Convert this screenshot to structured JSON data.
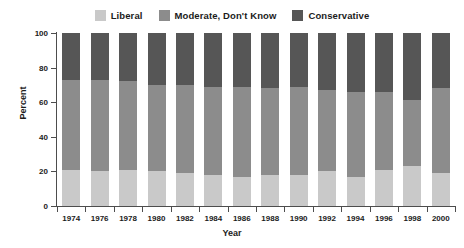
{
  "chart_data": {
    "type": "bar",
    "subtype": "stacked-bar-100-percent",
    "title": "",
    "xlabel": "Year",
    "ylabel": "Percent",
    "ylim": [
      0,
      100
    ],
    "yticks": [
      0,
      20,
      40,
      60,
      80,
      100
    ],
    "grid": false,
    "legend_position": "top-center",
    "categories": [
      "1974",
      "1976",
      "1978",
      "1980",
      "1982",
      "1984",
      "1986",
      "1988",
      "1990",
      "1992",
      "1994",
      "1996",
      "1998",
      "2000"
    ],
    "series": [
      {
        "name": "Liberal",
        "color": "#c9c9c9",
        "values": [
          21,
          20,
          21,
          20,
          19,
          18,
          17,
          18,
          18,
          20,
          17,
          21,
          23,
          19
        ]
      },
      {
        "name": "Moderate, Don't Know",
        "color": "#8c8c8c",
        "values": [
          52,
          53,
          51,
          50,
          51,
          51,
          52,
          50,
          51,
          47,
          49,
          45,
          38,
          49
        ]
      },
      {
        "name": "Conservative",
        "color": "#565656",
        "values": [
          27,
          27,
          28,
          30,
          30,
          31,
          31,
          32,
          31,
          33,
          34,
          34,
          39,
          32
        ]
      }
    ],
    "annotations": []
  },
  "legend": {
    "items": [
      {
        "label": "Liberal",
        "color": "#c9c9c9"
      },
      {
        "label": "Moderate, Don't Know",
        "color": "#8c8c8c"
      },
      {
        "label": "Conservative",
        "color": "#565656"
      }
    ]
  },
  "axes": {
    "y_title": "Percent",
    "x_title": "Year",
    "y_tick_labels": [
      "0",
      "20",
      "40",
      "60",
      "80",
      "100"
    ],
    "x_tick_labels": [
      "1974",
      "1976",
      "1978",
      "1980",
      "1982",
      "1984",
      "1986",
      "1988",
      "1990",
      "1992",
      "1994",
      "1996",
      "1998",
      "2000"
    ]
  },
  "caption": ""
}
